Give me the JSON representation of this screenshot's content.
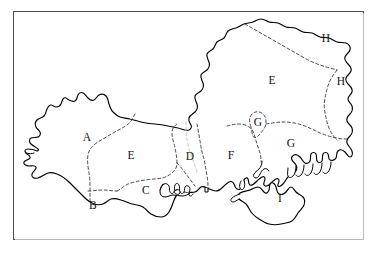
{
  "page": {
    "background_color": "#ffffff"
  },
  "frame": {
    "border_color": "#4a4a52",
    "shadow_color": "#b9b9bd",
    "fill_color": "#ffffff"
  },
  "map": {
    "style": "hand-drawn outline map",
    "coastline_color": "#000000",
    "boundary_color": "#2b2b2b",
    "boundary_style": "dashed",
    "region_letters": [
      "A",
      "B",
      "C",
      "D",
      "E",
      "F",
      "G",
      "H",
      "I"
    ],
    "labels": [
      {
        "id": "label-a",
        "text": "A",
        "x": 87,
        "y": 138
      },
      {
        "id": "label-b",
        "text": "B",
        "x": 93,
        "y": 206
      },
      {
        "id": "label-c",
        "text": "C",
        "x": 146,
        "y": 191
      },
      {
        "id": "label-d",
        "text": "D",
        "x": 190,
        "y": 157
      },
      {
        "id": "label-e1",
        "text": "E",
        "x": 131,
        "y": 156
      },
      {
        "id": "label-e2",
        "text": "E",
        "x": 272,
        "y": 81
      },
      {
        "id": "label-f",
        "text": "F",
        "x": 231,
        "y": 156
      },
      {
        "id": "label-g1",
        "text": "G",
        "x": 258,
        "y": 123
      },
      {
        "id": "label-g2",
        "text": "G",
        "x": 291,
        "y": 144
      },
      {
        "id": "label-h1",
        "text": "H",
        "x": 326,
        "y": 39
      },
      {
        "id": "label-h2",
        "text": "H",
        "x": 341,
        "y": 82
      },
      {
        "id": "label-i",
        "text": "I",
        "x": 280,
        "y": 199
      }
    ]
  }
}
